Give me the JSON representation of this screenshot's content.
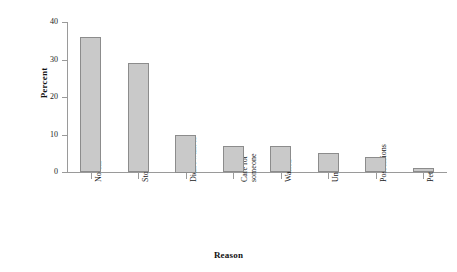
{
  "chart_data": {
    "type": "bar",
    "title": "",
    "xlabel": "Reason",
    "ylabel": "Percent",
    "categories": [
      "No car",
      "Storm not bad",
      "Didn't want to",
      "Care for someone",
      "Waited",
      "Unable",
      "Possessions",
      "Pet"
    ],
    "values": [
      36,
      29,
      10,
      7,
      7,
      5,
      4,
      1
    ],
    "ylim": [
      0,
      40
    ],
    "yticks": [
      0,
      10,
      20,
      30,
      40
    ],
    "ytick_labels": [
      "0",
      "10",
      "20",
      "30",
      "40"
    ],
    "grid": false,
    "legend": null,
    "bar_fill_color": "#c9c9c9",
    "bar_border_color": "#8c8c8c",
    "axis_color": "#9a9a9a",
    "background_color": "#ffffff"
  }
}
